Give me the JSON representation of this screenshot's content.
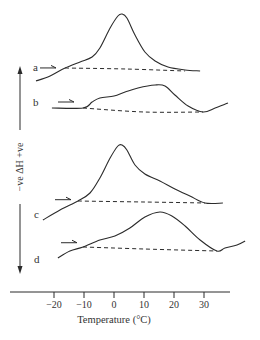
{
  "chart_data": {
    "type": "line",
    "title": "",
    "xlabel": "Temperature (°C)",
    "ylabel": "−ve ΔH +ve",
    "ylabel_arrows": "both",
    "x_ticks": [
      -20,
      -10,
      0,
      10,
      20,
      30
    ],
    "xlim": [
      -34,
      39
    ],
    "y_units": "arbitrary (stacked curves, no y-scale)",
    "grid": false,
    "legend": "none (curves labelled a–d at left)",
    "series": [
      {
        "name": "a",
        "label": "a",
        "points": [
          [
            -26,
            -13
          ],
          [
            -21.3,
            -8
          ],
          [
            -16.3,
            0
          ],
          [
            -11.3,
            6
          ],
          [
            -7.3,
            11
          ],
          [
            -4.7,
            20
          ],
          [
            -1.3,
            40
          ],
          [
            1.3,
            52
          ],
          [
            2.7,
            54
          ],
          [
            4.3,
            50
          ],
          [
            7,
            33
          ],
          [
            10.3,
            16
          ],
          [
            13.7,
            7
          ],
          [
            18,
            1
          ],
          [
            23.7,
            -2
          ],
          [
            28.7,
            -3
          ]
        ],
        "baseline": [
          [
            -16.3,
            0
          ],
          [
            4,
            -1
          ],
          [
            23.7,
            -3
          ]
        ],
        "heating_arrow_at": -22
      },
      {
        "name": "b",
        "label": "b",
        "points": [
          [
            -20.7,
            0
          ],
          [
            -10.3,
            0
          ],
          [
            -7.3,
            6
          ],
          [
            -4.7,
            10
          ],
          [
            0,
            12
          ],
          [
            3.7,
            16
          ],
          [
            8,
            20
          ],
          [
            13.7,
            23
          ],
          [
            17,
            22
          ],
          [
            20.3,
            13
          ],
          [
            24.7,
            2
          ],
          [
            29.7,
            -4
          ],
          [
            33.7,
            0
          ],
          [
            38,
            5
          ]
        ],
        "baseline": [
          [
            -10.3,
            0
          ],
          [
            10,
            -4
          ],
          [
            29.7,
            -4
          ]
        ],
        "heating_arrow_at": -16
      },
      {
        "name": "c",
        "label": "c",
        "points": [
          [
            -23.7,
            -19
          ],
          [
            -18,
            -9
          ],
          [
            -12,
            0
          ],
          [
            -8,
            8
          ],
          [
            -4.7,
            23
          ],
          [
            -1.3,
            43
          ],
          [
            1.3,
            55
          ],
          [
            2.7,
            56
          ],
          [
            4.3,
            51
          ],
          [
            7,
            36
          ],
          [
            10.3,
            27
          ],
          [
            15.3,
            20
          ],
          [
            20.3,
            12
          ],
          [
            25.3,
            5
          ],
          [
            30.3,
            -2
          ],
          [
            36.3,
            -2
          ]
        ],
        "baseline": [
          [
            -12,
            0
          ],
          [
            10,
            -1
          ],
          [
            30.3,
            -2
          ]
        ],
        "heating_arrow_at": -17
      },
      {
        "name": "d",
        "label": "d",
        "points": [
          [
            -18.7,
            -11
          ],
          [
            -14.7,
            -4
          ],
          [
            -10.3,
            0
          ],
          [
            -4.7,
            7
          ],
          [
            0.3,
            11
          ],
          [
            5.3,
            19
          ],
          [
            10.3,
            30
          ],
          [
            15.3,
            35
          ],
          [
            19.3,
            31
          ],
          [
            23.7,
            21
          ],
          [
            28.7,
            7
          ],
          [
            34.3,
            -4
          ],
          [
            37,
            -1
          ],
          [
            41,
            2
          ],
          [
            43.7,
            6
          ]
        ],
        "baseline": [
          [
            -10.3,
            0
          ],
          [
            10,
            -2
          ],
          [
            34.3,
            -4
          ]
        ],
        "heating_arrow_at": -15
      }
    ]
  }
}
